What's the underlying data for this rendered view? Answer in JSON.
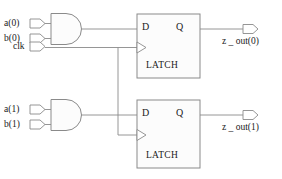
{
  "diagram": {
    "colors": {
      "background": "#ffffff",
      "wire": "#8a8a8a",
      "box_stroke": "#8a8a8a",
      "text": "#1a1a1a"
    },
    "inputs": [
      {
        "name": "a0",
        "label": "a(0)"
      },
      {
        "name": "b0",
        "label": "b(0)"
      },
      {
        "name": "clk",
        "label": "clk"
      },
      {
        "name": "a1",
        "label": "a(1)"
      },
      {
        "name": "b1",
        "label": "b(1)"
      }
    ],
    "gates": [
      {
        "name": "and-gate-0",
        "type": "AND"
      },
      {
        "name": "and-gate-1",
        "type": "AND"
      }
    ],
    "latches": [
      {
        "name": "latch-0",
        "title": "LATCH",
        "d_label": "D",
        "q_label": "Q",
        "clock_label": ""
      },
      {
        "name": "latch-1",
        "title": "LATCH",
        "d_label": "D",
        "q_label": "Q",
        "clock_label": ""
      }
    ],
    "outputs": [
      {
        "name": "z_out0",
        "label": "z _ out(0)"
      },
      {
        "name": "z_out1",
        "label": "z _ out(1)"
      }
    ]
  }
}
